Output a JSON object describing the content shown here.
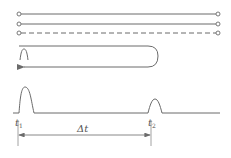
{
  "diagram": {
    "colors": {
      "stroke": "#6b6b6b",
      "background": "#ffffff"
    },
    "fiber_lines": [
      {
        "style": "solid",
        "y": 14
      },
      {
        "style": "solid",
        "y": 24
      },
      {
        "style": "dashed",
        "y": 33
      }
    ],
    "loop": {
      "description": "rounded return path with leftward arrow and small pulse"
    },
    "waveform": {
      "labels": {
        "t1": "t",
        "t1_sub": "1",
        "t2": "t",
        "t2_sub": "2",
        "delta": "Δt"
      }
    }
  }
}
